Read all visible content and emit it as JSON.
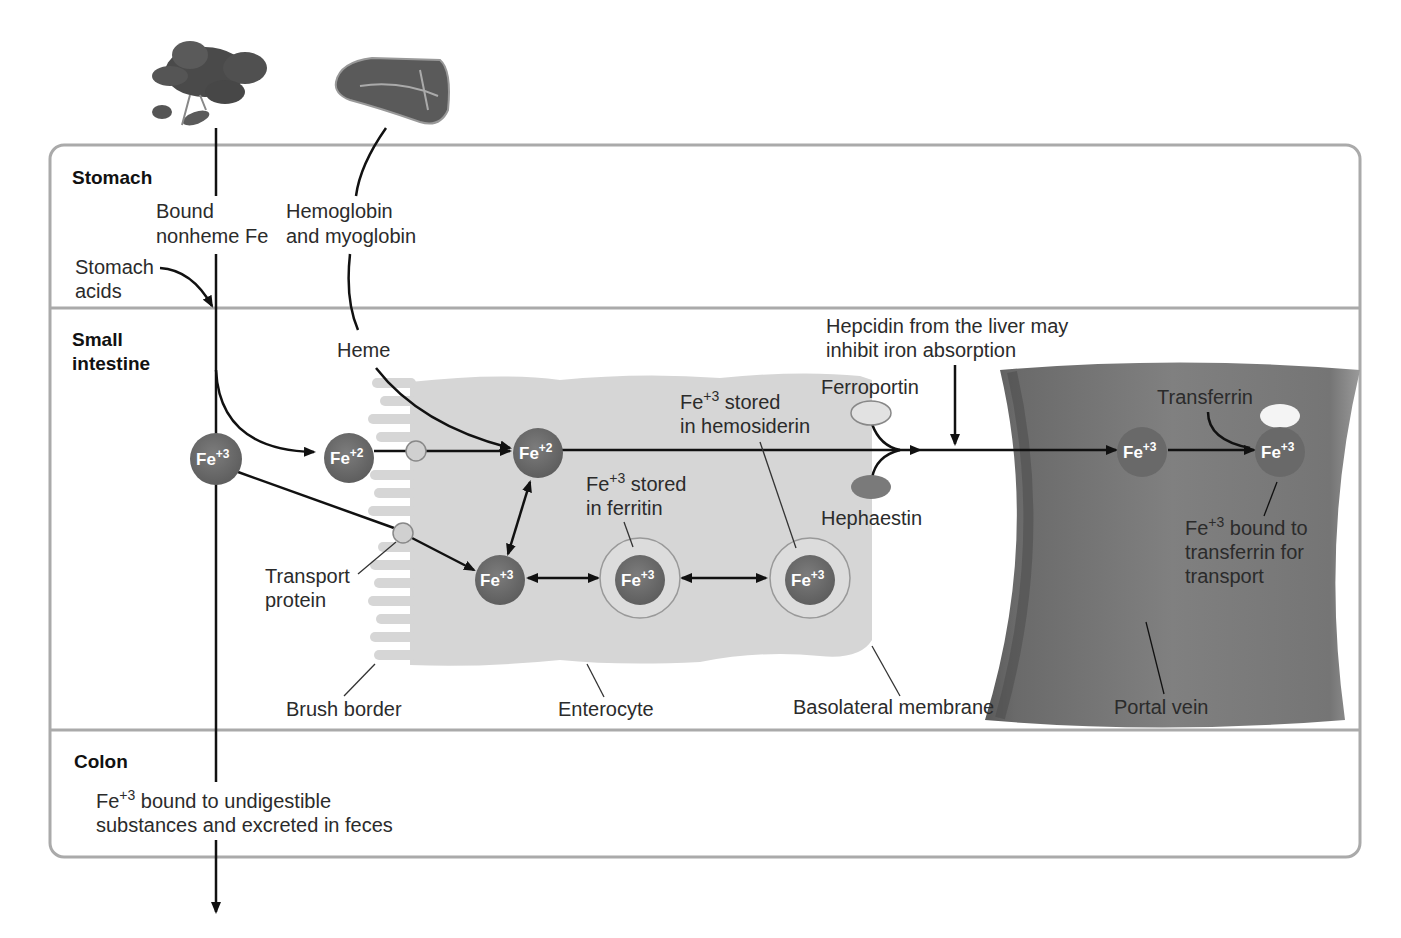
{
  "sections": {
    "stomach": "Stomach",
    "small_intestine_line1": "Small",
    "small_intestine_line2": "intestine",
    "colon": "Colon"
  },
  "food_sources": {
    "plant": "leafy-greens-illustration",
    "meat": "steak-illustration"
  },
  "stomach_labels": {
    "bound_nonheme_1": "Bound",
    "bound_nonheme_2": "nonheme Fe",
    "hemoglobin_1": "Hemoglobin",
    "hemoglobin_2": "and myoglobin",
    "stomach_acids_1": "Stomach",
    "stomach_acids_2": "acids"
  },
  "intestine_labels": {
    "heme": "Heme",
    "hepcidin_1": "Hepcidin from the liver may",
    "hepcidin_2": "inhibit iron absorption",
    "ferroportin": "Ferroportin",
    "hephaestin": "Hephaestin",
    "transferrin": "Transferrin",
    "hemosiderin_fe": "Fe",
    "hemosiderin_sup": "+3",
    "hemosiderin_1": " stored",
    "hemosiderin_2": "in hemosiderin",
    "ferritin_fe": "Fe",
    "ferritin_sup": "+3",
    "ferritin_1": " stored",
    "ferritin_2": "in ferritin",
    "bound_fe": "Fe",
    "bound_sup": "+3",
    "bound_1": " bound to",
    "bound_2": "transferrin for",
    "bound_3": "transport",
    "transport_protein_1": "Transport",
    "transport_protein_2": "protein",
    "brush_border": "Brush border",
    "enterocyte": "Enterocyte",
    "basolateral": "Basolateral membrane",
    "portal_vein": "Portal vein"
  },
  "ions": {
    "fe3_lumen": {
      "base": "Fe",
      "charge": "+3"
    },
    "fe2_lumen": {
      "base": "Fe",
      "charge": "+2"
    },
    "fe2_cell": {
      "base": "Fe",
      "charge": "+2"
    },
    "fe3_cell": {
      "base": "Fe",
      "charge": "+3"
    },
    "fe3_ferritin": {
      "base": "Fe",
      "charge": "+3"
    },
    "fe3_hemosiderin": {
      "base": "Fe",
      "charge": "+3"
    },
    "fe3_vein": {
      "base": "Fe",
      "charge": "+3"
    },
    "fe3_transferrin": {
      "base": "Fe",
      "charge": "+3"
    }
  },
  "colon_labels": {
    "fe": "Fe",
    "sup": "+3",
    "line1": " bound to undigestible",
    "line2": "substances and excreted in feces"
  },
  "colors": {
    "ion_fill": "#6e6e6e",
    "cell_fill": "#d4d4d4",
    "vein_fill": "#7a7a7a",
    "panel_border": "#b0b0b0",
    "arrow": "#111111"
  }
}
